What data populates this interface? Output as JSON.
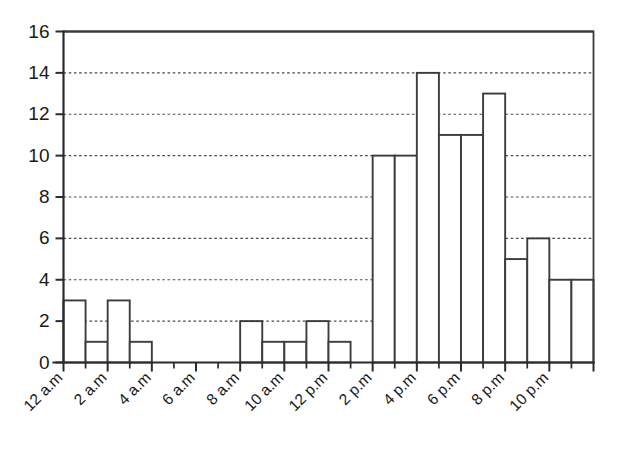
{
  "chart_data": {
    "type": "bar",
    "title": "",
    "subtitle": "",
    "xlabel": "",
    "ylabel": "",
    "ylim": [
      0,
      16
    ],
    "ytick_step": 2,
    "yticks": [
      0,
      2,
      4,
      6,
      8,
      10,
      12,
      14,
      16
    ],
    "ytick_labels": [
      "0",
      "2",
      "4",
      "6",
      "8",
      "10",
      "12",
      "14",
      "16"
    ],
    "grid": true,
    "grid_axis": "y",
    "legend": null,
    "legend_position": "none",
    "bar_style": "histogram-adjacent-unfilled",
    "categories": [
      "12 a.m",
      "1 a.m",
      "2 a.m",
      "3 a.m",
      "4 a.m",
      "5 a.m",
      "6 a.m",
      "7 a.m",
      "8 a.m",
      "9 a.m",
      "10 a.m",
      "11 a.m",
      "12 p.m",
      "1 p.m",
      "2 p.m",
      "3 p.m",
      "4 p.m",
      "5 p.m",
      "6 p.m",
      "7 p.m",
      "8 p.m",
      "9 p.m",
      "10 p.m",
      "11 p.m"
    ],
    "values": [
      3,
      1,
      3,
      1,
      0,
      0,
      0,
      0,
      2,
      1,
      1,
      2,
      1,
      0,
      10,
      10,
      14,
      11,
      11,
      13,
      5,
      6,
      4,
      4
    ],
    "xtick_labels": [
      "12 a.m",
      "2 a.m",
      "4 a.m",
      "6 a.m",
      "8 a.m",
      "10 a.m",
      "12 p.m",
      "2 p.m",
      "4 p.m",
      "6 p.m",
      "8 p.m",
      "10 p.m"
    ],
    "xtick_label_rotation": -45,
    "xtick_every": 2,
    "colors": {
      "bar_fill": "#ffffff",
      "bar_stroke": "#3c3c3c",
      "axis": "#2b2b2b",
      "grid": "#4a4a4a",
      "text": "#1a1a1a",
      "background": "#ffffff"
    }
  }
}
